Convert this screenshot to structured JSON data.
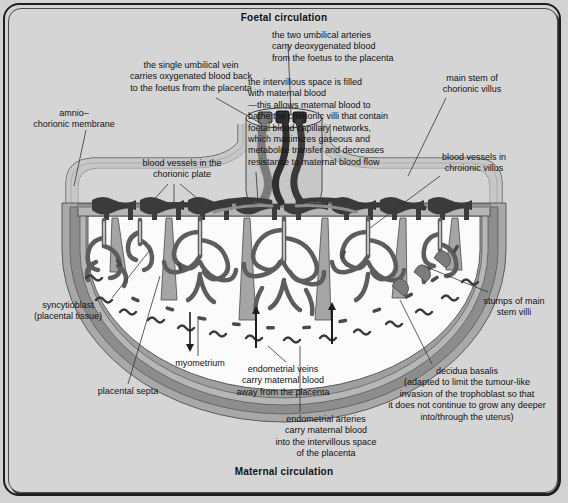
{
  "figure": {
    "title_top": "Foetal circulation",
    "title_bottom": "Maternal circulation"
  },
  "annotations": {
    "umbilical_vein": "the single umbilical vein\ncarries oxygenated blood back\nto the foetus from the placenta",
    "umbilical_arteries": "the two umbilical arteries\ncarry deoxygenated blood\nfrom the foetus to the placenta",
    "intervillous_space": "the intervillous space is filled\nwith maternal blood\n—this allows maternal blood to\nbathe the chorionic villi that contain\nfoetal blood capillary networks,\nwhich maximizes gaseous and\nmetabolite transfer and decreases\nresistance to maternal blood flow",
    "main_stem": "main stem of\nchorionic villus",
    "amnio_chorionic_membrane": "amnio–\nchorionic membrane",
    "chorionic_plate_vessels": "blood vessels in the\nchorionic plate",
    "villus_vessels": "blood vessels in\nchroionic villus",
    "syncytioblast": "syncytioblast\n(placental tissue)",
    "stumps": "stumps of main\nstem villi",
    "placental_septa": "placental septa",
    "myometrium": "myometrium",
    "endometrial_veins": "endometrial veins\ncarry maternal blood\naway from the placenta",
    "endometrial_arteries": "endometrial arteries\ncarry maternal blood\ninto the intervillous space\nof the placenta",
    "decidua_basalis": "decidua basalis\n(adapted to limit the tumour-like\ninvasion of the trophoblast so that\nit does not continue to grow any deeper\ninto/through the uterus)"
  },
  "colors": {
    "background": "#d2d2d2",
    "frame_dark": "#1d1d1d",
    "text": "#111111",
    "artery_dark": "#4a4a4a",
    "vein_mid": "#8a8a8a",
    "tissue_light": "#b9b9b9",
    "tissue_mid": "#9a9a9a",
    "tissue_dark": "#6f6f6f",
    "intervillous_space": "#fbfbfb",
    "leader_line": "#3a3a3a"
  }
}
